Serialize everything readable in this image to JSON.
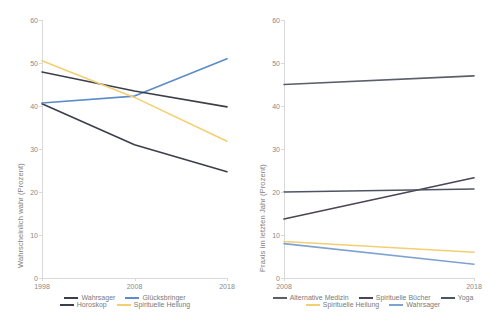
{
  "chart_data": [
    {
      "type": "line",
      "panel": "left",
      "title": "",
      "xlabel": "",
      "ylabel": "Wahrscheinlich wahr (Prozent)",
      "x": [
        1998,
        2008,
        2018
      ],
      "xticklabels": [
        "1998",
        "2008",
        "2018"
      ],
      "yticklabels": [
        "0",
        "10",
        "20",
        "30",
        "40",
        "50",
        "60"
      ],
      "ylim": [
        0,
        60
      ],
      "ytick_step": 10,
      "grid": false,
      "legend_position": "bottom",
      "series": [
        {
          "name": "Wahrsager",
          "values": [
            40.5,
            31.0,
            24.7
          ],
          "color": "#3b3f4a"
        },
        {
          "name": "Glücksbringer",
          "values": [
            40.7,
            42.3,
            51.0
          ],
          "color": "#5b8cc8"
        },
        {
          "name": "Horoskop",
          "values": [
            47.9,
            43.5,
            39.8
          ],
          "color": "#3b3f4a"
        },
        {
          "name": "Spirituelle Heilung",
          "values": [
            50.5,
            42.0,
            31.8
          ],
          "color": "#f2cf72"
        }
      ]
    },
    {
      "type": "line",
      "panel": "right",
      "title": "",
      "xlabel": "",
      "ylabel": "Praxis im letzten Jahr (Prozent)",
      "x": [
        2008,
        2018
      ],
      "xticklabels": [
        "2008",
        "2018"
      ],
      "yticklabels": [
        "0",
        "10",
        "20",
        "30",
        "40",
        "50",
        "60"
      ],
      "ylim": [
        0,
        60
      ],
      "ytick_step": 10,
      "grid": false,
      "legend_position": "bottom",
      "series": [
        {
          "name": "Alternative Medizin",
          "values": [
            45.0,
            47.0
          ],
          "color": "#5a5f6b"
        },
        {
          "name": "Spirituelle Bücher",
          "values": [
            13.7,
            23.3
          ],
          "color": "#4b4557"
        },
        {
          "name": "Yoga",
          "values": [
            20.0,
            20.7
          ],
          "color": "#4e5562"
        },
        {
          "name": "Spirituelle Heilung",
          "values": [
            8.5,
            6.0
          ],
          "color": "#f2cf72"
        },
        {
          "name": "Wahrsager",
          "values": [
            8.0,
            3.2
          ],
          "color": "#7fa3d1"
        }
      ]
    }
  ]
}
